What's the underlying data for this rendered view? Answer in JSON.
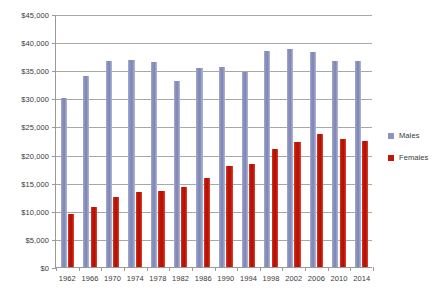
{
  "chart_data": {
    "type": "bar",
    "title": "",
    "xlabel": "",
    "ylabel": "",
    "ylim": [
      0,
      45000
    ],
    "ytick_values": [
      0,
      5000,
      10000,
      15000,
      20000,
      25000,
      30000,
      35000,
      40000,
      45000
    ],
    "ytick_labels": [
      "$0",
      "$5,000",
      "$10,000",
      "$15,000",
      "$20,000",
      "$25,000",
      "$30,000",
      "$35,000",
      "$40,000",
      "$45,000"
    ],
    "grid": true,
    "legend_position": "right",
    "categories": [
      "1962",
      "1966",
      "1970",
      "1974",
      "1978",
      "1982",
      "1986",
      "1990",
      "1994",
      "1998",
      "2002",
      "2006",
      "2010",
      "2014"
    ],
    "series": [
      {
        "name": "Males",
        "color": "#8d94c0",
        "values": [
          30000,
          34000,
          36700,
          36800,
          36400,
          33000,
          35400,
          35600,
          34600,
          38500,
          38700,
          38200,
          36700,
          36700
        ]
      },
      {
        "name": "Females",
        "color": "#c01808",
        "values": [
          9500,
          10600,
          12400,
          13400,
          13600,
          14200,
          15900,
          17900,
          18400,
          21000,
          22300,
          23700,
          22700,
          22400
        ]
      }
    ]
  },
  "legend": {
    "items": [
      {
        "label": "Males",
        "swatch": "#8d94c0"
      },
      {
        "label": "Females",
        "swatch": "#c01808"
      }
    ]
  }
}
